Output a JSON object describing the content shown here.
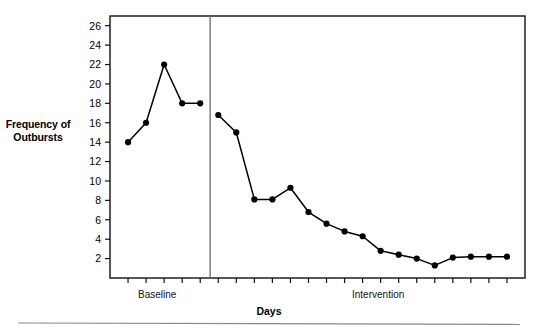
{
  "chart_data": {
    "type": "line",
    "title": "",
    "xlabel": "Days",
    "ylabel": "Frequency of Outbursts",
    "ylim": [
      0,
      27
    ],
    "yticks": [
      2,
      4,
      6,
      8,
      10,
      12,
      14,
      16,
      18,
      20,
      22,
      24,
      26
    ],
    "xlim": [
      0,
      23
    ],
    "grid": false,
    "legend": "none",
    "frame": "box",
    "marker": "filled-circle",
    "line_color": "#000000",
    "phases": [
      {
        "name": "Baseline",
        "label": "Baseline",
        "x": [
          1,
          2,
          3,
          4,
          5
        ],
        "values": [
          14,
          16,
          22,
          18,
          18
        ]
      },
      {
        "name": "Intervention",
        "label": "Intervention",
        "x": [
          6,
          7,
          8,
          9,
          10,
          11,
          12,
          13,
          14,
          15,
          16,
          17,
          18,
          19,
          20,
          21,
          22
        ],
        "values": [
          16.8,
          15,
          8.1,
          8.1,
          9.3,
          6.8,
          5.6,
          4.8,
          4.3,
          2.8,
          2.4,
          2.0,
          1.3,
          2.1,
          2.2,
          2.2,
          2.2
        ]
      }
    ],
    "phase_divider_x": 5.55,
    "series": [
      {
        "name": "Frequency of Outbursts",
        "x": [
          1,
          2,
          3,
          4,
          5,
          6,
          7,
          8,
          9,
          10,
          11,
          12,
          13,
          14,
          15,
          16,
          17,
          18,
          19,
          20,
          21,
          22
        ],
        "values": [
          14,
          16,
          22,
          18,
          18,
          16.8,
          15,
          8.1,
          8.1,
          9.3,
          6.8,
          5.6,
          4.8,
          4.3,
          2.8,
          2.4,
          2.0,
          1.3,
          2.1,
          2.2,
          2.2,
          2.2
        ]
      }
    ]
  },
  "axis": {
    "y_label_line1": "Frequency of",
    "y_label_line2": "Outbursts",
    "x_title": "Days",
    "y_tick_labels": [
      "26",
      "24",
      "22",
      "20",
      "18",
      "16",
      "14",
      "12",
      "10",
      "8",
      "6",
      "4",
      "2"
    ]
  },
  "phase_labels": {
    "baseline": "Baseline",
    "intervention": "Intervention"
  },
  "colors": {
    "ink": "#000000",
    "divider": "#6b6b6b",
    "frame": "#111111",
    "footer_rule": "#8a8a8a"
  }
}
